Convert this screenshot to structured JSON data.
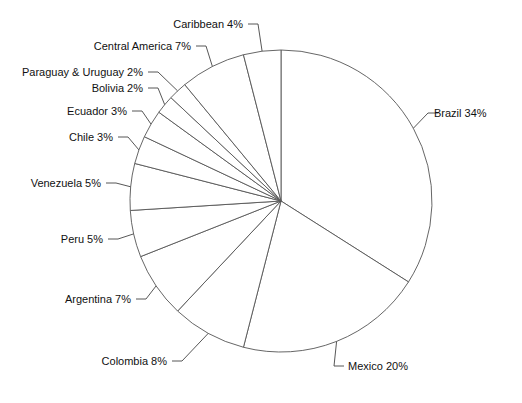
{
  "chart_data": {
    "type": "pie",
    "title": "",
    "subtitle": "",
    "xlabel": "",
    "ylabel": "",
    "legend_position": "none",
    "grid": false,
    "start_angle_deg": 0,
    "direction": "clockwise",
    "value_unit": "%",
    "categories": [
      "Brazil",
      "Mexico",
      "Colombia",
      "Argentina",
      "Peru",
      "Venezuela",
      "Chile",
      "Ecuador",
      "Bolivia",
      "Paraguay & Uruguay",
      "Central America",
      "Caribbean"
    ],
    "values": [
      34,
      20,
      8,
      7,
      5,
      5,
      3,
      3,
      2,
      2,
      7,
      4
    ],
    "labels": [
      "Brazil  34%",
      "Mexico  20%",
      "Colombia  8%",
      "Argentina  7%",
      "Peru  5%",
      "Venezuela  5%",
      "Chile  3%",
      "Ecuador  3%",
      "Bolivia  2%",
      "Paraguay & Uruguay  2%",
      "Central America  7%",
      "Caribbean  4%"
    ],
    "slices": [
      {
        "name": "Brazil",
        "value": 34,
        "label": "Brazil  34%"
      },
      {
        "name": "Mexico",
        "value": 20,
        "label": "Mexico  20%"
      },
      {
        "name": "Colombia",
        "value": 8,
        "label": "Colombia  8%"
      },
      {
        "name": "Argentina",
        "value": 7,
        "label": "Argentina  7%"
      },
      {
        "name": "Peru",
        "value": 5,
        "label": "Peru  5%"
      },
      {
        "name": "Venezuela",
        "value": 5,
        "label": "Venezuela  5%"
      },
      {
        "name": "Chile",
        "value": 3,
        "label": "Chile  3%"
      },
      {
        "name": "Ecuador",
        "value": 3,
        "label": "Ecuador  3%"
      },
      {
        "name": "Bolivia",
        "value": 2,
        "label": "Bolivia  2%"
      },
      {
        "name": "Paraguay & Uruguay",
        "value": 2,
        "label": "Paraguay & Uruguay  2%"
      },
      {
        "name": "Central America",
        "value": 7,
        "label": "Central America  7%"
      },
      {
        "name": "Caribbean",
        "value": 4,
        "label": "Caribbean  4%"
      }
    ],
    "colors": {
      "slice_fill": "#ffffff",
      "slice_stroke": "#555555",
      "leader_line": "#444444",
      "label_text": "#111111",
      "background": "#ffffff"
    }
  }
}
